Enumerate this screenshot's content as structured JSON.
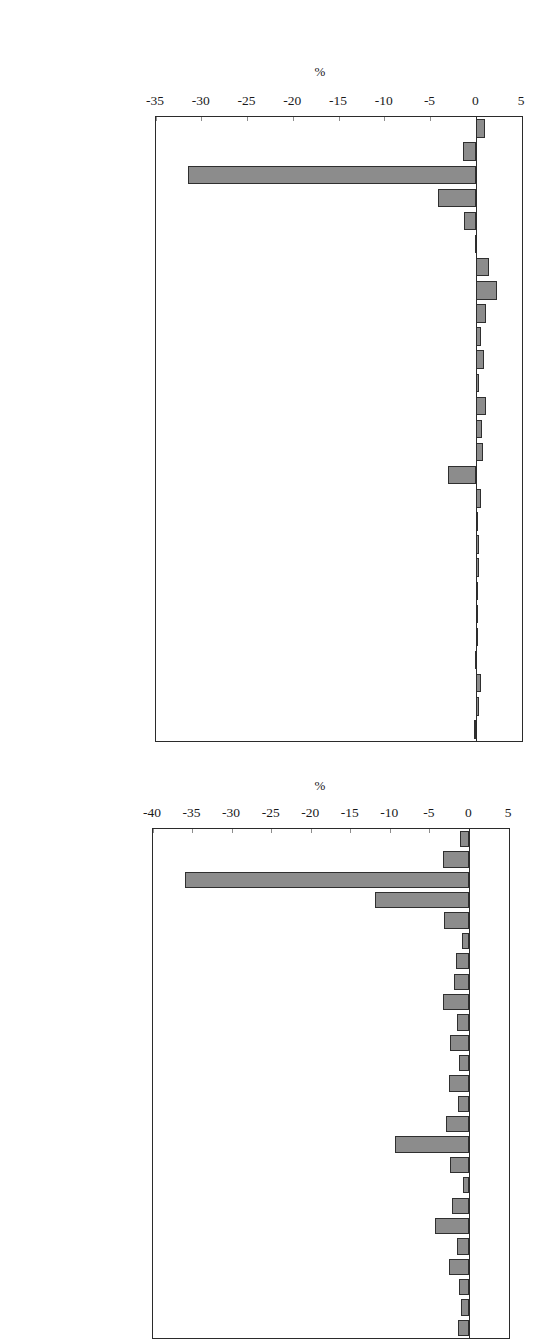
{
  "chart_data": [
    {
      "id": "chart-top",
      "type": "bar",
      "orientation": "horizontal",
      "title": "",
      "xlabel": "%",
      "ylabel": "",
      "xlim": [
        -35,
        5
      ],
      "ticks": [
        -35,
        -30,
        -25,
        -20,
        -15,
        -10,
        -5,
        0,
        5
      ],
      "tick_labels": [
        "-35",
        "-30",
        "-25",
        "-20",
        "-15",
        "-10",
        "-5",
        "0",
        "5"
      ],
      "grid": false,
      "legend": "none",
      "bar_color": "#8c8c8c",
      "bar_edge_color": "#2f2f2f",
      "categories": [
        "Agriculture",
        "Metal Mining",
        "Coal Mining",
        "Crude Oil",
        "Other Mining",
        "Construction",
        "Food Products",
        "Tobacco",
        "Textiles",
        "Apparel",
        "Lumber, Wood",
        "Furniture",
        "Paper",
        "Printing",
        "Chemicals",
        "Refining",
        "Rubber, Plastic",
        "Leather",
        "Glass, etc.",
        "Primary Metals",
        "Fab. metals",
        "Nonelec. Mach.",
        "Elec. Mach.",
        "Motor Vehicles",
        "Other Trans Eq",
        "Instruments",
        "Misc. manufac."
      ],
      "values": [
        1.0,
        -1.4,
        -31.5,
        -4.2,
        -1.3,
        -0.15,
        1.4,
        2.3,
        1.1,
        0.5,
        0.85,
        0.35,
        1.1,
        0.6,
        0.75,
        -3.1,
        0.5,
        0.2,
        0.35,
        0.25,
        0.1,
        0.05,
        0.0,
        -0.1,
        0.55,
        0.25,
        -0.2
      ]
    },
    {
      "id": "chart-bottom",
      "type": "bar",
      "orientation": "horizontal",
      "title": "",
      "xlabel": "%",
      "ylabel": "",
      "xlim": [
        -40,
        5
      ],
      "ticks": [
        -40,
        -35,
        -30,
        -25,
        -20,
        -15,
        -10,
        -5,
        0,
        5
      ],
      "tick_labels": [
        "-40",
        "-35",
        "-30",
        "-25",
        "-20",
        "-15",
        "-10",
        "-5",
        "0",
        "5"
      ],
      "grid": false,
      "legend": "none",
      "bar_color": "#8c8c8c",
      "bar_edge_color": "#2f2f2f",
      "categories": [
        "Agriculture",
        "Metal Mining",
        "Coal Mining",
        "Crude Oil",
        "Other Mining",
        "Construction",
        "Food Products",
        "Tobacco",
        "Textiles",
        "Apparel",
        "Lumber, Wood",
        "Furniture",
        "Paper",
        "Printing",
        "Chemicals",
        "Refining",
        "Rubber, Plastic",
        "Leather",
        "Glass, etc.",
        "Primary Metals",
        "Fab. metals",
        "Nonelec. Mach.",
        "Elec. Mach.",
        "Motor Vehicles",
        "Other Trans Eq"
      ],
      "values": [
        -1.2,
        -3.4,
        -36.0,
        -12.0,
        -3.2,
        -0.9,
        -1.7,
        -2.0,
        -3.3,
        -1.6,
        -2.5,
        -1.3,
        -2.6,
        -1.5,
        -3.0,
        -9.4,
        -2.4,
        -0.8,
        -2.2,
        -4.3,
        -1.6,
        -2.6,
        -1.3,
        -1.1,
        -1.5
      ]
    }
  ]
}
